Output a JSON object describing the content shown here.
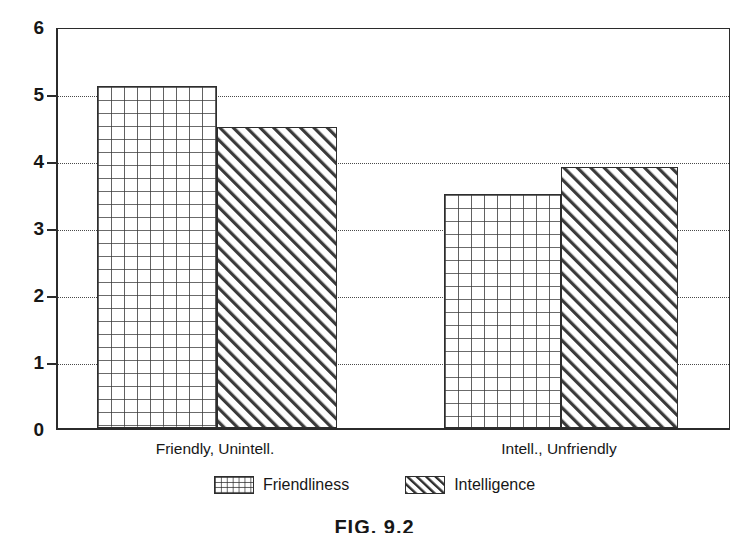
{
  "chart_data": {
    "type": "bar",
    "title": "",
    "subtitle": "",
    "xlabel": "",
    "ylabel": "",
    "categories": [
      "Friendly, Unintell.",
      "Intell., Unfriendly"
    ],
    "series": [
      {
        "name": "Friendliness",
        "values": [
          5.1,
          3.5
        ],
        "pattern": "crosshatch"
      },
      {
        "name": "Intelligence",
        "values": [
          4.5,
          3.9
        ],
        "pattern": "diagonal-stripes"
      }
    ],
    "ylim": [
      0,
      6
    ],
    "yticks": [
      0,
      1,
      2,
      3,
      4,
      5,
      6
    ],
    "ytick_labels": [
      "0",
      "1",
      "2",
      "3",
      "4",
      "5",
      "6"
    ],
    "gridlines": [
      1,
      2,
      3,
      4,
      5
    ],
    "grid": true,
    "grid_style": "dotted",
    "legend_position": "bottom",
    "legend_entries": [
      "Friendliness",
      "Intelligence"
    ],
    "colors": {
      "axis": "#2b2b2b",
      "grid": "#4a4a4a",
      "bar_outline": "#2d2d2d",
      "bar_fill": "#ffffff",
      "pattern_stroke": "#303030",
      "background": "#ffffff",
      "text": "#171717"
    }
  },
  "figure": {
    "caption": "FIG. 9.2"
  }
}
